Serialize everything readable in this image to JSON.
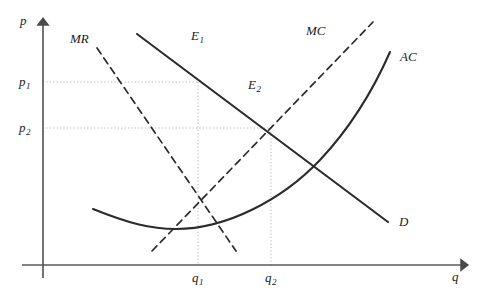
{
  "figure": {
    "type": "economics-diagram",
    "background_color": "#ffffff",
    "curve_color": "#2b2b2b",
    "axis_color": "#555555",
    "guide_color": "#b0b0b0"
  },
  "axes": {
    "y_label": "p",
    "x_label": "q",
    "origin": {
      "x": 43,
      "y": 265
    },
    "y_top": {
      "x": 43,
      "y": 18
    },
    "x_right": {
      "x": 470,
      "y": 265
    }
  },
  "price_ticks": [
    {
      "label": "p",
      "sub": "1",
      "value_y": 82
    },
    {
      "label": "p",
      "sub": "2",
      "value_y": 128
    }
  ],
  "quantity_ticks": [
    {
      "label": "q",
      "sub": "1",
      "value_x": 198
    },
    {
      "label": "q",
      "sub": "2",
      "value_x": 271
    }
  ],
  "curves": [
    {
      "name": "demand",
      "label": "D",
      "style": "solid",
      "label_position": {
        "x": 399,
        "y": 215
      }
    },
    {
      "name": "marginal-revenue",
      "label": "MR",
      "style": "dashed",
      "label_position": {
        "x": 70,
        "y": 32
      }
    },
    {
      "name": "marginal-cost",
      "label": "MC",
      "style": "dashed",
      "label_position": {
        "x": 306,
        "y": 24
      }
    },
    {
      "name": "average-cost",
      "label": "AC",
      "style": "solid",
      "label_position": {
        "x": 400,
        "y": 50
      }
    }
  ],
  "equilibria": [
    {
      "name": "monopoly-equilibrium",
      "label": "E",
      "sub": "1",
      "label_position": {
        "x": 191,
        "y": 29
      },
      "point": {
        "x": 198,
        "y": 82
      },
      "price_tick": "p1",
      "quantity_tick": "q1"
    },
    {
      "name": "average-cost-equilibrium",
      "label": "E",
      "sub": "2",
      "label_position": {
        "x": 248,
        "y": 78
      },
      "point": {
        "x": 271,
        "y": 128
      },
      "price_tick": "p2",
      "quantity_tick": "q2"
    }
  ]
}
